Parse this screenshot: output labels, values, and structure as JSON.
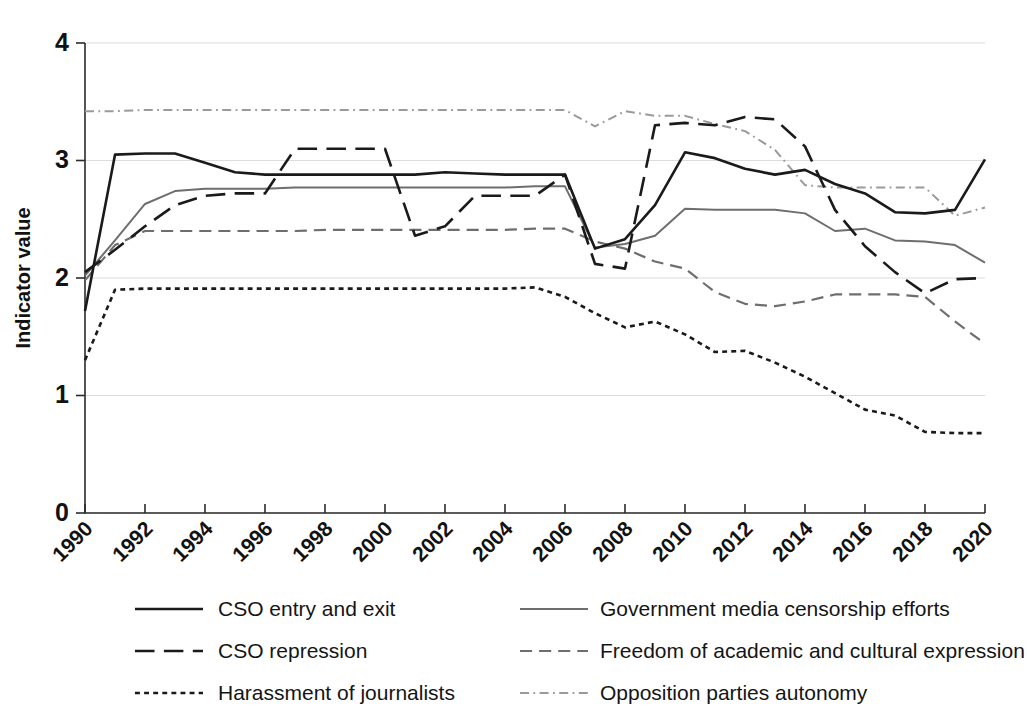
{
  "chart_data": {
    "type": "line",
    "title": "",
    "subtitle": "",
    "xlabel": "",
    "ylabel": "Indicator value",
    "xlim": [
      1990,
      2020
    ],
    "ylim": [
      0,
      4
    ],
    "ytick_labels": [
      "0",
      "1",
      "2",
      "3",
      "4"
    ],
    "yticks": [
      0,
      1,
      2,
      3,
      4
    ],
    "xticks": [
      1990,
      1992,
      1994,
      1996,
      1998,
      2000,
      2002,
      2004,
      2006,
      2008,
      2010,
      2012,
      2014,
      2016,
      2018,
      2020
    ],
    "xtick_labels": [
      "1990",
      "1992",
      "1994",
      "1996",
      "1998",
      "2000",
      "2002",
      "2004",
      "2006",
      "2008",
      "2010",
      "2012",
      "2014",
      "2016",
      "2018",
      "2020"
    ],
    "grid": "horizontal",
    "legend_position": "below",
    "legend_columns": 2,
    "x": [
      1990,
      1991,
      1992,
      1993,
      1994,
      1995,
      1996,
      1997,
      1998,
      1999,
      2000,
      2001,
      2002,
      2003,
      2004,
      2005,
      2006,
      2007,
      2008,
      2009,
      2010,
      2011,
      2012,
      2013,
      2014,
      2015,
      2016,
      2017,
      2018,
      2019,
      2020
    ],
    "series": [
      {
        "name": "CSO entry and exit",
        "dash": "solid",
        "color": "#1a1a1a",
        "width": 2.6,
        "values": [
          1.72,
          3.05,
          3.06,
          3.06,
          2.98,
          2.9,
          2.88,
          2.88,
          2.88,
          2.88,
          2.88,
          2.88,
          2.9,
          2.89,
          2.88,
          2.88,
          2.88,
          2.25,
          2.33,
          2.62,
          3.07,
          3.02,
          2.93,
          2.88,
          2.92,
          2.8,
          2.72,
          2.56,
          2.55,
          2.58,
          3.01
        ]
      },
      {
        "name": "CSO repression",
        "dash": "dashed-long",
        "color": "#1a1a1a",
        "width": 2.6,
        "values": [
          2.05,
          2.24,
          2.44,
          2.62,
          2.7,
          2.72,
          2.72,
          3.1,
          3.1,
          3.1,
          3.1,
          2.36,
          2.44,
          2.7,
          2.7,
          2.7,
          2.88,
          2.12,
          2.08,
          3.3,
          3.32,
          3.3,
          3.37,
          3.35,
          3.12,
          2.58,
          2.27,
          2.05,
          1.87,
          1.99,
          2.0
        ]
      },
      {
        "name": "Harassment of journalists",
        "dash": "dotted",
        "color": "#1a1a1a",
        "width": 2.6,
        "values": [
          1.3,
          1.9,
          1.91,
          1.91,
          1.91,
          1.91,
          1.91,
          1.91,
          1.91,
          1.91,
          1.91,
          1.91,
          1.91,
          1.91,
          1.91,
          1.92,
          1.84,
          1.7,
          1.58,
          1.63,
          1.52,
          1.37,
          1.38,
          1.28,
          1.16,
          1.02,
          0.88,
          0.83,
          0.69,
          0.68,
          0.68
        ]
      },
      {
        "name": "Government media censorship efforts",
        "dash": "solid",
        "color": "#6e6e6e",
        "width": 2.0,
        "values": [
          2.02,
          2.32,
          2.63,
          2.74,
          2.76,
          2.76,
          2.76,
          2.77,
          2.77,
          2.77,
          2.77,
          2.77,
          2.77,
          2.77,
          2.77,
          2.78,
          2.78,
          2.26,
          2.29,
          2.36,
          2.59,
          2.58,
          2.58,
          2.58,
          2.55,
          2.4,
          2.42,
          2.32,
          2.31,
          2.28,
          2.13
        ]
      },
      {
        "name": "Freedom of academic and cultural expression",
        "dash": "dashed-medium",
        "color": "#6e6e6e",
        "width": 2.2,
        "values": [
          1.98,
          2.28,
          2.4,
          2.4,
          2.4,
          2.4,
          2.4,
          2.4,
          2.41,
          2.41,
          2.41,
          2.41,
          2.41,
          2.41,
          2.41,
          2.42,
          2.42,
          2.31,
          2.25,
          2.14,
          2.08,
          1.88,
          1.78,
          1.76,
          1.8,
          1.86,
          1.86,
          1.86,
          1.84,
          1.63,
          1.44
        ]
      },
      {
        "name": "Opposition parties autonomy",
        "dash": "dashdot",
        "color": "#9a9a9a",
        "width": 2.0,
        "values": [
          3.42,
          3.42,
          3.43,
          3.43,
          3.43,
          3.43,
          3.43,
          3.43,
          3.43,
          3.43,
          3.43,
          3.43,
          3.43,
          3.43,
          3.43,
          3.43,
          3.43,
          3.29,
          3.42,
          3.38,
          3.38,
          3.31,
          3.25,
          3.09,
          2.79,
          2.77,
          2.77,
          2.77,
          2.77,
          2.53,
          2.6
        ]
      }
    ]
  },
  "legend": {
    "items": [
      {
        "label": "CSO entry and exit"
      },
      {
        "label": "Government media censorship efforts"
      },
      {
        "label": "CSO repression"
      },
      {
        "label": "Freedom of academic and cultural expression"
      },
      {
        "label": "Harassment of journalists"
      },
      {
        "label": "Opposition parties autonomy"
      }
    ]
  }
}
